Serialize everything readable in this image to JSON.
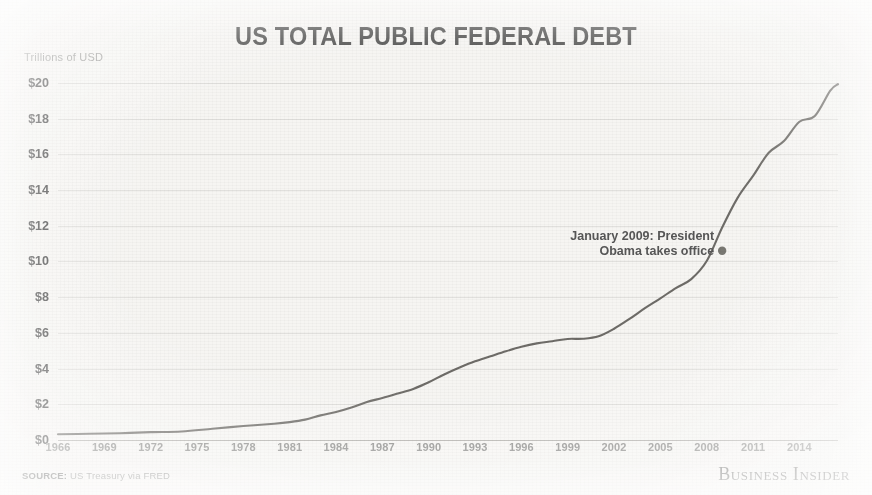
{
  "header": {
    "title": "US TOTAL PUBLIC FEDERAL DEBT",
    "axis_unit": "Trillions of USD"
  },
  "footer": {
    "source_label": "SOURCE:",
    "source_text": "US Treasury via FRED",
    "brand": "Business Insider"
  },
  "annotation": {
    "line1": "January 2009: President",
    "line2": "Obama takes office"
  },
  "colors": {
    "background": "#f6f5f2",
    "line": "#5f5d59",
    "title": "#4a4a4a",
    "ylabel": "#4f4f4f",
    "xlabel": "#8e8e8c",
    "grid": "#bab8b2"
  },
  "chart_data": {
    "type": "line",
    "title": "US TOTAL PUBLIC FEDERAL DEBT",
    "xlabel": "",
    "ylabel": "Trillions of USD",
    "xlim": [
      1966,
      2016.5
    ],
    "ylim": [
      0,
      21
    ],
    "grid": true,
    "legend": false,
    "ytick_labels": [
      "$0",
      "$2",
      "$4",
      "$6",
      "$8",
      "$10",
      "$12",
      "$14",
      "$16",
      "$18",
      "$20"
    ],
    "ytick_values": [
      0,
      2,
      4,
      6,
      8,
      10,
      12,
      14,
      16,
      18,
      20
    ],
    "xtick_labels": [
      "1966",
      "1969",
      "1972",
      "1975",
      "1978",
      "1981",
      "1984",
      "1987",
      "1990",
      "1993",
      "1996",
      "1999",
      "2002",
      "2005",
      "2008",
      "2011",
      "2014"
    ],
    "xtick_values": [
      1966,
      1969,
      1972,
      1975,
      1978,
      1981,
      1984,
      1987,
      1990,
      1993,
      1996,
      1999,
      2002,
      2005,
      2008,
      2011,
      2014
    ],
    "series": [
      {
        "name": "US Total Public Federal Debt",
        "x": [
          1966,
          1968,
          1970,
          1972,
          1974,
          1976,
          1978,
          1980,
          1981,
          1982,
          1983,
          1984,
          1985,
          1986,
          1987,
          1988,
          1989,
          1990,
          1991,
          1992,
          1993,
          1994,
          1995,
          1996,
          1997,
          1998,
          1999,
          2000,
          2001,
          2002,
          2003,
          2004,
          2005,
          2006,
          2007,
          2008,
          2009,
          2010,
          2011,
          2012,
          2013,
          2014,
          2015,
          2016,
          2016.5
        ],
        "y": [
          0.32,
          0.35,
          0.38,
          0.44,
          0.48,
          0.63,
          0.78,
          0.91,
          1.0,
          1.14,
          1.38,
          1.57,
          1.82,
          2.13,
          2.35,
          2.6,
          2.86,
          3.23,
          3.67,
          4.06,
          4.41,
          4.69,
          4.97,
          5.22,
          5.41,
          5.53,
          5.66,
          5.67,
          5.81,
          6.23,
          6.78,
          7.38,
          7.93,
          8.51,
          9.01,
          10.02,
          11.9,
          13.56,
          14.79,
          16.07,
          16.74,
          17.82,
          18.15,
          19.57,
          19.93
        ]
      }
    ],
    "annotations": [
      {
        "text": "January 2009: President Obama takes office",
        "x": 2009,
        "y": 10.6,
        "marker": true
      }
    ]
  }
}
